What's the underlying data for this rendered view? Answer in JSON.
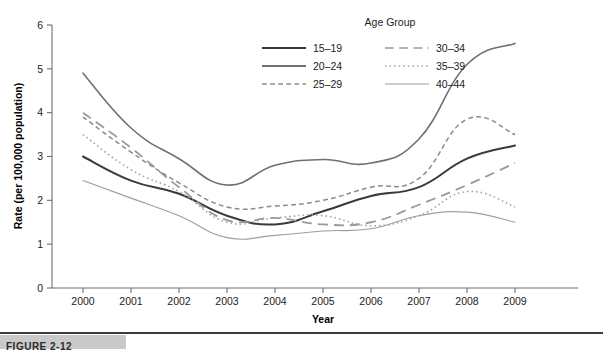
{
  "figure": {
    "caption_label": "FIGURE 2-12"
  },
  "chart_data": {
    "type": "line",
    "title": "",
    "xlabel": "Year",
    "ylabel": "Rate (per 100,000 population)",
    "legend_title": "Age Group",
    "legend_position": "top-right-inside",
    "grid": false,
    "x": [
      2000,
      2001,
      2002,
      2003,
      2004,
      2005,
      2006,
      2007,
      2008,
      2009
    ],
    "categories": [
      "2000",
      "2001",
      "2002",
      "2003",
      "2004",
      "2005",
      "2006",
      "2007",
      "2008",
      "2009"
    ],
    "xticklabels": [
      "2000",
      "2001",
      "2002",
      "2003",
      "2004",
      "2005",
      "2006",
      "2007",
      "2008",
      "2009"
    ],
    "yticklabels": [
      "0",
      "1",
      "2",
      "3",
      "4",
      "5",
      "6"
    ],
    "ylim": [
      0,
      6
    ],
    "ytick_values": [
      0,
      1,
      2,
      3,
      4,
      5,
      6
    ],
    "series": [
      {
        "name": "15–19",
        "style": "solid",
        "color": "#3a3a3a",
        "width": 2.0,
        "values": [
          3.0,
          2.45,
          2.15,
          1.65,
          1.45,
          1.75,
          2.1,
          2.3,
          2.95,
          3.25
        ]
      },
      {
        "name": "20–24",
        "style": "solid",
        "color": "#707070",
        "width": 1.6,
        "values": [
          4.9,
          3.65,
          2.95,
          2.35,
          2.8,
          2.93,
          2.85,
          3.4,
          5.1,
          5.58
        ]
      },
      {
        "name": "25–29",
        "style": "dashed",
        "color": "#8a8a8a",
        "width": 1.5,
        "values": [
          3.9,
          3.1,
          2.4,
          1.85,
          1.87,
          2.0,
          2.3,
          2.5,
          3.85,
          3.5
        ]
      },
      {
        "name": "30–34",
        "style": "long-dash",
        "color": "#9a9a9a",
        "width": 1.8,
        "values": [
          4.0,
          3.2,
          2.3,
          1.55,
          1.6,
          1.45,
          1.5,
          1.9,
          2.35,
          2.85
        ]
      },
      {
        "name": "35–39",
        "style": "dotted",
        "color": "#a0a0a0",
        "width": 1.6,
        "values": [
          3.5,
          2.7,
          2.2,
          1.5,
          1.6,
          1.65,
          1.42,
          1.65,
          2.2,
          1.85
        ]
      },
      {
        "name": "40–44",
        "style": "solid",
        "color": "#9e9e9e",
        "width": 1.1,
        "values": [
          2.45,
          2.05,
          1.65,
          1.15,
          1.2,
          1.3,
          1.35,
          1.65,
          1.73,
          1.5
        ]
      }
    ],
    "legend_entries": [
      {
        "label": "15–19",
        "style": "solid",
        "color": "#3a3a3a",
        "width": 2.0,
        "column": 0,
        "row": 0
      },
      {
        "label": "20–24",
        "style": "solid",
        "color": "#707070",
        "width": 1.8,
        "column": 0,
        "row": 1
      },
      {
        "label": "25–29",
        "style": "dashed",
        "color": "#8a8a8a",
        "width": 1.5,
        "column": 0,
        "row": 2
      },
      {
        "label": "30–34",
        "style": "long-dash",
        "color": "#9a9a9a",
        "width": 1.6,
        "column": 1,
        "row": 0
      },
      {
        "label": "35–39",
        "style": "dotted",
        "color": "#a0a0a0",
        "width": 1.6,
        "column": 1,
        "row": 1
      },
      {
        "label": "40–44",
        "style": "solid",
        "color": "#9e9e9e",
        "width": 1.2,
        "column": 1,
        "row": 2
      }
    ]
  },
  "colors": {
    "axis": "#6e6e6e",
    "text": "#1d1d1d",
    "background": "#ffffff",
    "caption_tab": "#c9c9c9",
    "caption_rule": "#3b3b3b"
  }
}
